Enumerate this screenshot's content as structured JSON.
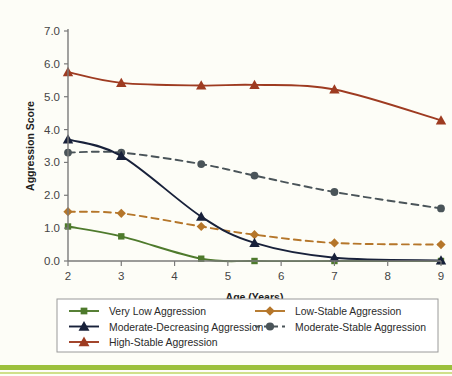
{
  "chart_data": {
    "type": "line",
    "title": "",
    "xlabel": "Age (Years)",
    "ylabel": "Aggression Score",
    "x": [
      2,
      3,
      4.5,
      5.5,
      7,
      9
    ],
    "xlim": [
      2,
      9
    ],
    "ylim": [
      0.0,
      7.0
    ],
    "xticks": [
      "2",
      "3",
      "4",
      "5",
      "6",
      "7",
      "8",
      "9"
    ],
    "xtick_values": [
      2,
      3,
      4,
      5,
      6,
      7,
      8,
      9
    ],
    "yticks": [
      "0.0",
      "1.0",
      "2.0",
      "3.0",
      "4.0",
      "5.0",
      "6.0",
      "7.0"
    ],
    "ytick_values": [
      0,
      1,
      2,
      3,
      4,
      5,
      6,
      7
    ],
    "grid": false,
    "legend_position": "bottom",
    "series": [
      {
        "name": "Very Low Aggression",
        "values": [
          1.05,
          0.75,
          0.07,
          0.0,
          0.0,
          0.0
        ],
        "color": "#4e7a2c",
        "marker": "square",
        "dash": "solid"
      },
      {
        "name": "Low-Stable Aggression",
        "values": [
          1.5,
          1.45,
          1.05,
          0.8,
          0.55,
          0.5
        ],
        "color": "#b5762a",
        "marker": "diamond",
        "dash": "dashed"
      },
      {
        "name": "Moderate-Decreasing Aggression",
        "values": [
          3.7,
          3.2,
          1.35,
          0.55,
          0.1,
          0.02
        ],
        "color": "#18213a",
        "marker": "triangle",
        "dash": "solid"
      },
      {
        "name": "Moderate-Stable Aggression",
        "values": [
          3.3,
          3.3,
          2.95,
          2.6,
          2.1,
          1.6
        ],
        "color": "#4a5459",
        "marker": "circle",
        "dash": "dashed"
      },
      {
        "name": "High-Stable Aggression",
        "values": [
          5.75,
          5.42,
          5.34,
          5.36,
          5.22,
          4.28
        ],
        "color": "#9e3b21",
        "marker": "triangle",
        "dash": "solid"
      }
    ]
  },
  "legend": {
    "entries": [
      {
        "label": "Very Low Aggression"
      },
      {
        "label": "Moderate-Decreasing Aggression"
      },
      {
        "label": "High-Stable Aggression"
      },
      {
        "label": "Low-Stable Aggression"
      },
      {
        "label": "Moderate-Stable Aggression"
      }
    ]
  },
  "axes": {
    "x_title": "Age (Years)",
    "y_title": "Aggression Score"
  },
  "colors": {
    "background": "#fdfdf7",
    "axis": "#7a7a7a",
    "accent_band": "#9cc03c"
  }
}
